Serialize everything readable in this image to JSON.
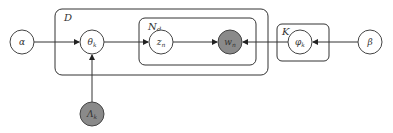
{
  "diagram": {
    "nodes": [
      {
        "id": "alpha",
        "label": "α",
        "observed": false
      },
      {
        "id": "theta",
        "label": "θk",
        "observed": false
      },
      {
        "id": "z",
        "label": "zn",
        "observed": false
      },
      {
        "id": "w",
        "label": "wn",
        "observed": true
      },
      {
        "id": "phi",
        "label": "φk",
        "observed": false
      },
      {
        "id": "beta",
        "label": "β",
        "observed": false
      },
      {
        "id": "lambda",
        "label": "Λk",
        "observed": true
      }
    ],
    "plates": [
      {
        "id": "D",
        "label": "D"
      },
      {
        "id": "Nd",
        "label": "Nd"
      },
      {
        "id": "K",
        "label": "K"
      }
    ],
    "edges": [
      [
        "alpha",
        "theta"
      ],
      [
        "theta",
        "z"
      ],
      [
        "z",
        "w"
      ],
      [
        "phi",
        "w"
      ],
      [
        "beta",
        "phi"
      ],
      [
        "lambda",
        "theta"
      ]
    ]
  },
  "labels": {
    "alpha": "α",
    "theta": "θ",
    "theta_sub": "k",
    "z": "z",
    "z_sub": "n",
    "w": "w",
    "w_sub": "n",
    "phi": "φ",
    "phi_sub": "k",
    "beta": "β",
    "lambda": "Λ",
    "lambda_sub": "k",
    "plate_D": "D",
    "plate_N": "N",
    "plate_N_sub": "d",
    "plate_K": "K"
  }
}
